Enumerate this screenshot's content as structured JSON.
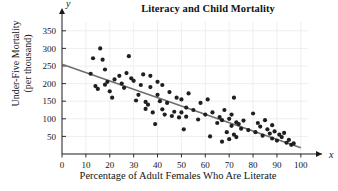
{
  "chart_data": {
    "type": "scatter",
    "title": "Literacy and Child Mortality",
    "xlabel": "Percentage of Adult Females Who Are Literate",
    "ylabel_line1": "Under-Five Mortality",
    "ylabel_line2": "(per thousand)",
    "x_axis_letter": "x",
    "y_axis_letter": "y",
    "xlim": [
      0,
      103
    ],
    "ylim": [
      0,
      375
    ],
    "xticks": [
      0,
      10,
      20,
      30,
      40,
      50,
      60,
      70,
      80,
      90,
      100
    ],
    "yticks": [
      50,
      100,
      150,
      200,
      250,
      300,
      350
    ],
    "grid": true,
    "grid_color": "#e8e8e8",
    "point_color": "#1f1f1f",
    "line_color": "#6e6e6e",
    "axis_color": "#1a1a1a",
    "legend": null,
    "trendline": {
      "label": "least-squares regression line",
      "x_start": 0,
      "y_start": 255,
      "x_end": 100,
      "y_end": 18
    },
    "points": [
      [
        12,
        228
      ],
      [
        13,
        272
      ],
      [
        14,
        193
      ],
      [
        15,
        185
      ],
      [
        16,
        300
      ],
      [
        17,
        268
      ],
      [
        18,
        240
      ],
      [
        18,
        197
      ],
      [
        19,
        205
      ],
      [
        20,
        178
      ],
      [
        21,
        160
      ],
      [
        22,
        212
      ],
      [
        24,
        222
      ],
      [
        25,
        200
      ],
      [
        26,
        188
      ],
      [
        27,
        230
      ],
      [
        28,
        278
      ],
      [
        29,
        215
      ],
      [
        30,
        208
      ],
      [
        31,
        152
      ],
      [
        32,
        168
      ],
      [
        33,
        196
      ],
      [
        34,
        226
      ],
      [
        35,
        148
      ],
      [
        35,
        128
      ],
      [
        36,
        140
      ],
      [
        37,
        222
      ],
      [
        37,
        190
      ],
      [
        38,
        118
      ],
      [
        39,
        85
      ],
      [
        40,
        205
      ],
      [
        40,
        168
      ],
      [
        41,
        150
      ],
      [
        42,
        127
      ],
      [
        42,
        196
      ],
      [
        43,
        112
      ],
      [
        44,
        145
      ],
      [
        45,
        176
      ],
      [
        46,
        108
      ],
      [
        47,
        120
      ],
      [
        48,
        160
      ],
      [
        49,
        104
      ],
      [
        50,
        118
      ],
      [
        50,
        155
      ],
      [
        51,
        70
      ],
      [
        52,
        106
      ],
      [
        52,
        132
      ],
      [
        53,
        172
      ],
      [
        55,
        125
      ],
      [
        57,
        98
      ],
      [
        58,
        145
      ],
      [
        60,
        112
      ],
      [
        61,
        155
      ],
      [
        62,
        50
      ],
      [
        63,
        118
      ],
      [
        65,
        88
      ],
      [
        66,
        105
      ],
      [
        67,
        35
      ],
      [
        67,
        96
      ],
      [
        68,
        125
      ],
      [
        69,
        62
      ],
      [
        70,
        100
      ],
      [
        70,
        42
      ],
      [
        71,
        80
      ],
      [
        71,
        112
      ],
      [
        72,
        55
      ],
      [
        72,
        160
      ],
      [
        73,
        48
      ],
      [
        73,
        90
      ],
      [
        74,
        85
      ],
      [
        75,
        72
      ],
      [
        76,
        95
      ],
      [
        78,
        68
      ],
      [
        80,
        115
      ],
      [
        81,
        62
      ],
      [
        82,
        88
      ],
      [
        83,
        78
      ],
      [
        84,
        52
      ],
      [
        85,
        96
      ],
      [
        86,
        70
      ],
      [
        87,
        58
      ],
      [
        88,
        82
      ],
      [
        88,
        44
      ],
      [
        89,
        64
      ],
      [
        90,
        38
      ],
      [
        91,
        55
      ],
      [
        92,
        48
      ],
      [
        93,
        60
      ],
      [
        94,
        32
      ],
      [
        95,
        40
      ],
      [
        96,
        26
      ],
      [
        97,
        30
      ]
    ]
  }
}
